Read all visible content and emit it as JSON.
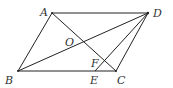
{
  "diagram": {
    "type": "geometry",
    "points": {
      "A": {
        "label": "A",
        "x": 52,
        "y": 13
      },
      "B": {
        "label": "B",
        "x": 18,
        "y": 71
      },
      "C": {
        "label": "C",
        "x": 116,
        "y": 71
      },
      "D": {
        "label": "D",
        "x": 148,
        "y": 13
      },
      "E": {
        "label": "E",
        "x": 95,
        "y": 71
      },
      "F": {
        "label": "F",
        "x": 103,
        "y": 62
      },
      "O": {
        "label": "O",
        "x": 83,
        "y": 42
      }
    },
    "segments": [
      {
        "name": "AB",
        "from": "A",
        "to": "B"
      },
      {
        "name": "BC",
        "from": "B",
        "to": "C"
      },
      {
        "name": "CD",
        "from": "C",
        "to": "D"
      },
      {
        "name": "DA",
        "from": "D",
        "to": "A"
      },
      {
        "name": "AC",
        "from": "A",
        "to": "C"
      },
      {
        "name": "BD",
        "from": "B",
        "to": "D"
      },
      {
        "name": "DE",
        "from": "D",
        "to": "E"
      }
    ],
    "labels": {
      "A": "A",
      "B": "B",
      "C": "C",
      "D": "D",
      "E": "E",
      "F": "F",
      "O": "O"
    },
    "colors": {
      "line": "#222222",
      "text": "#333333",
      "background": "#ffffff"
    }
  }
}
